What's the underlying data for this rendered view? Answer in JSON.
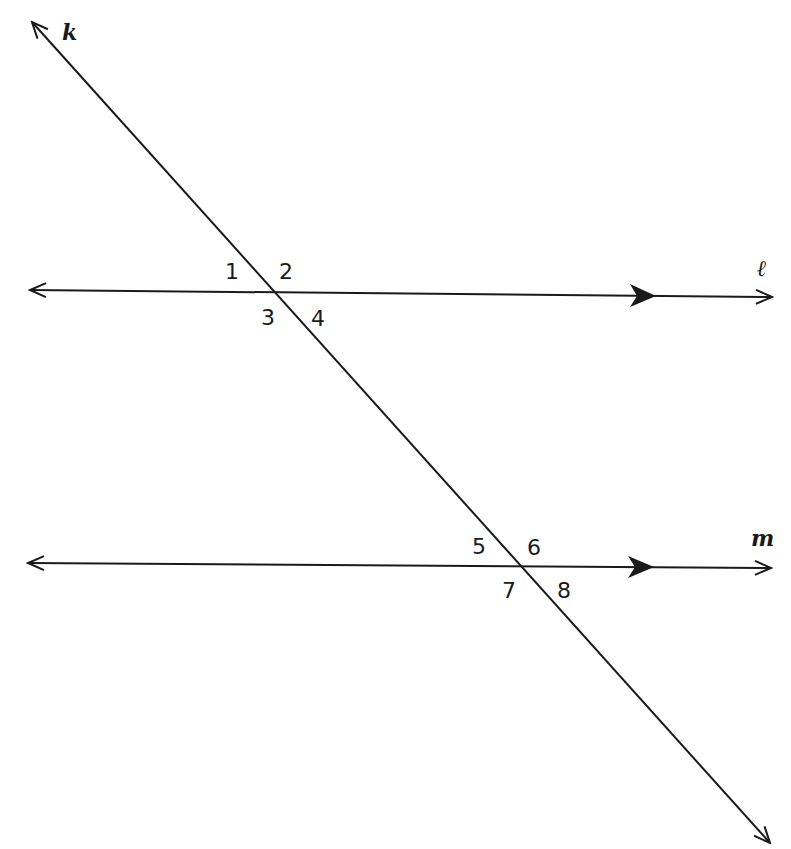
{
  "diagram": {
    "stroke_color": "#1a1a1a",
    "lines": {
      "k": {
        "label": "k",
        "role": "transversal"
      },
      "l": {
        "label": "ℓ",
        "role": "parallel line"
      },
      "m": {
        "label": "m",
        "role": "parallel line"
      }
    },
    "angles_at_l": [
      "1",
      "2",
      "3",
      "4"
    ],
    "angles_at_m": [
      "5",
      "6",
      "7",
      "8"
    ],
    "parallel_marker": "single filled arrowhead on each of l and m"
  }
}
